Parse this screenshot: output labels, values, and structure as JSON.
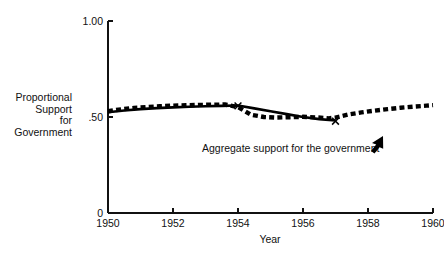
{
  "chart_data": {
    "type": "line",
    "title": "",
    "subtitle": "",
    "xlabel": "Year",
    "ylabel": "Proportional Support for Government",
    "ylabel_lines": [
      "Proportional",
      "Support",
      "for",
      "Government"
    ],
    "xlim": [
      1950,
      1960
    ],
    "ylim": [
      0,
      1.0
    ],
    "grid": false,
    "legend_position": "none",
    "y_ticks": [
      {
        "value": 1.0,
        "label": "1.00"
      },
      {
        "value": 0.5,
        "label": ".50"
      },
      {
        "value": 0.0,
        "label": "0"
      }
    ],
    "x_ticks": [
      {
        "value": 1950,
        "label": "1950"
      },
      {
        "value": 1952,
        "label": "1952"
      },
      {
        "value": 1954,
        "label": "1954"
      },
      {
        "value": 1956,
        "label": "1956"
      },
      {
        "value": 1958,
        "label": "1958"
      },
      {
        "value": 1960,
        "label": "1960"
      }
    ],
    "series": [
      {
        "name": "Aggregate support for the government",
        "style": "solid",
        "x": [
          1950.0,
          1950.5,
          1951.0,
          1951.5,
          1952.0,
          1952.5,
          1953.0,
          1953.5,
          1954.0,
          1954.5,
          1955.0,
          1955.5,
          1956.0,
          1956.5,
          1957.0
        ],
        "values": [
          0.525,
          0.534,
          0.541,
          0.546,
          0.55,
          0.553,
          0.556,
          0.558,
          0.56,
          0.545,
          0.53,
          0.515,
          0.5,
          0.489,
          0.482
        ]
      },
      {
        "name": "Survey series",
        "style": "dashed-square-markers",
        "x": [
          1950.0,
          1950.4,
          1950.8,
          1951.2,
          1951.6,
          1952.0,
          1952.4,
          1952.8,
          1953.2,
          1953.6,
          1954.0,
          1954.4,
          1954.8,
          1955.2,
          1955.6,
          1956.0,
          1956.4,
          1956.8,
          1957.0,
          1957.4,
          1957.8,
          1958.2,
          1958.6,
          1959.0,
          1959.4,
          1959.8,
          1960.0
        ],
        "values": [
          0.53,
          0.54,
          0.547,
          0.552,
          0.556,
          0.559,
          0.561,
          0.563,
          0.564,
          0.565,
          0.552,
          0.512,
          0.5,
          0.497,
          0.499,
          0.501,
          0.498,
          0.493,
          0.497,
          0.513,
          0.524,
          0.533,
          0.541,
          0.548,
          0.554,
          0.559,
          0.562
        ]
      }
    ],
    "point_markers": [
      {
        "label": "X",
        "x": 1954.0,
        "y": 0.558
      },
      {
        "label": "X",
        "x": 1957.0,
        "y": 0.478
      }
    ],
    "annotations": [
      {
        "text": "Aggregate support for the government",
        "x": 1955.1,
        "y": 0.36,
        "arrow": "up-right"
      }
    ]
  },
  "figure": {
    "background_color": "#ffffff",
    "foreground_color": "#000000"
  }
}
